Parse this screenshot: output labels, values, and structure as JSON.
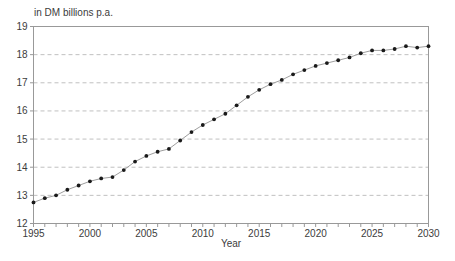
{
  "chart_data": {
    "type": "line",
    "title": "in DM billions p.a.",
    "xlabel": "Year",
    "ylabel": "",
    "legend": "none",
    "grid": "horizontal-dashed",
    "marker": "filled-circle",
    "xlim": [
      1995,
      2030
    ],
    "ylim": [
      12,
      19
    ],
    "x_ticks": [
      1995,
      2000,
      2005,
      2010,
      2015,
      2020,
      2025,
      2030
    ],
    "x_minor_step": 1,
    "y_ticks": [
      12,
      13,
      14,
      15,
      16,
      17,
      18,
      19
    ],
    "x": [
      1995,
      1996,
      1997,
      1998,
      1999,
      2000,
      2001,
      2002,
      2003,
      2004,
      2005,
      2006,
      2007,
      2008,
      2009,
      2010,
      2011,
      2012,
      2013,
      2014,
      2015,
      2016,
      2017,
      2018,
      2019,
      2020,
      2021,
      2022,
      2023,
      2024,
      2025,
      2026,
      2027,
      2028,
      2029,
      2030
    ],
    "values": [
      12.75,
      12.9,
      13.0,
      13.2,
      13.35,
      13.5,
      13.6,
      13.65,
      13.9,
      14.2,
      14.4,
      14.55,
      14.65,
      14.95,
      15.25,
      15.5,
      15.7,
      15.9,
      16.2,
      16.5,
      16.75,
      16.95,
      17.1,
      17.3,
      17.45,
      17.6,
      17.7,
      17.8,
      17.9,
      18.05,
      18.15,
      18.15,
      18.2,
      18.3,
      18.25,
      18.3
    ],
    "colors": {
      "point": "#1a1a1a",
      "line": "#9e9e9e",
      "grid": "#c0c0c0",
      "frame": "#999999",
      "text": "#3c3c3c",
      "background": "#ffffff"
    }
  }
}
